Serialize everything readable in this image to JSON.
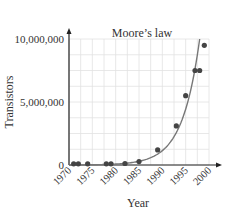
{
  "chart_data": {
    "type": "scatter",
    "title": "Moore’s law",
    "xlabel": "Year",
    "ylabel": "Transistors",
    "xlim": [
      1970,
      2000
    ],
    "ylim": [
      0,
      10000000
    ],
    "x_ticks": [
      "1970",
      "1975",
      "1980",
      "1985",
      "1990",
      "1995",
      "2000"
    ],
    "y_ticks": [
      "0",
      "5,000,000",
      "10,000,000"
    ],
    "grid": true,
    "legend": null,
    "series": [
      {
        "name": "Transistor count",
        "kind": "scatter",
        "x": [
          1971,
          1972,
          1974,
          1978,
          1979,
          1982,
          1985,
          1989,
          1993,
          1995,
          1997,
          1998,
          1999
        ],
        "y": [
          2300,
          3500,
          6000,
          29000,
          29000,
          120000,
          275000,
          1200000,
          3100000,
          5500000,
          7500000,
          7500000,
          9500000
        ]
      },
      {
        "name": "Exponential fit",
        "kind": "line",
        "x": [
          1970,
          1975,
          1980,
          1983,
          1985,
          1987,
          1989,
          1991,
          1993,
          1995,
          1997,
          1998
        ],
        "y": [
          5000,
          18000,
          60000,
          130000,
          220000,
          420000,
          800000,
          1500000,
          2900000,
          5300000,
          8400000,
          10000000
        ]
      }
    ],
    "colors": {
      "points": "#444444",
      "curve": "#777777",
      "grid": "#e2e2e2",
      "axis": "#222222"
    }
  }
}
